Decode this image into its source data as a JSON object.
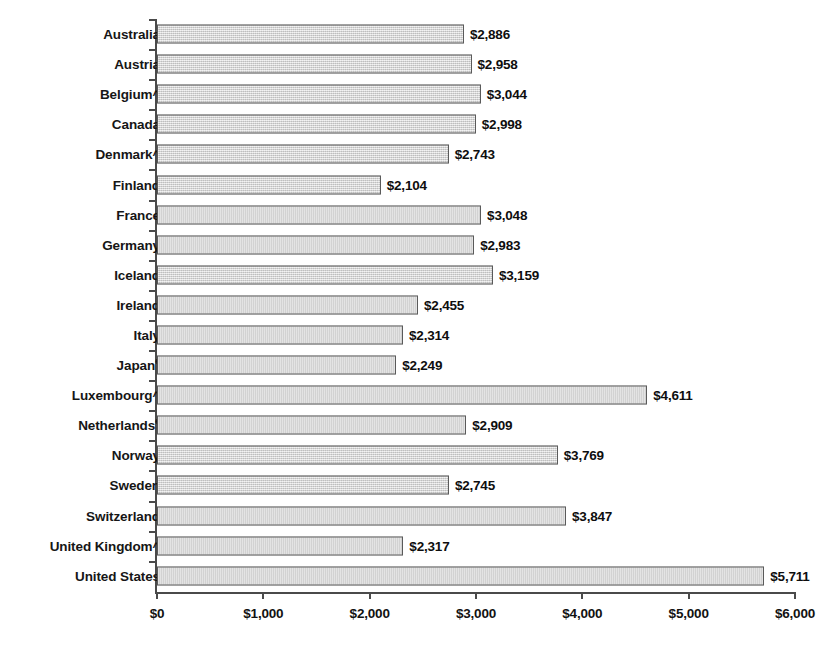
{
  "chart_data": {
    "type": "bar",
    "orientation": "horizontal",
    "title": "",
    "subtitle": "",
    "xlabel": "",
    "ylabel": "",
    "xlim": [
      0,
      6000
    ],
    "grid": false,
    "legend": null,
    "value_prefix": "$",
    "categories": [
      "Australia",
      "Austria",
      "Belgium^",
      "Canada",
      "Denmark^",
      "Finland",
      "France",
      "Germany",
      "Iceland",
      "Ireland",
      "Italy",
      "Japanᵉ",
      "Luxembourg^",
      "Netherlandsᵉ",
      "Norway",
      "Sweden",
      "Switzerland",
      "United Kingdom^",
      "United States"
    ],
    "values": [
      2886,
      2958,
      3044,
      2998,
      2743,
      2104,
      3048,
      2983,
      3159,
      2455,
      2314,
      2249,
      4611,
      2909,
      3769,
      2745,
      3847,
      2317,
      5711
    ],
    "value_labels": [
      "$2,886",
      "$2,958",
      "$3,044",
      "$2,998",
      "$2,743",
      "$2,104",
      "$3,048",
      "$2,983",
      "$3,159",
      "$2,455",
      "$2,314",
      "$2,249",
      "$4,611",
      "$2,909",
      "$3,769",
      "$2,745",
      "$3,847",
      "$2,317",
      "$5,711"
    ],
    "category_marks": [
      "",
      "",
      "^",
      "",
      "^",
      "",
      "",
      "",
      "",
      "",
      "",
      "e",
      "^",
      "e",
      "",
      "",
      "",
      "^",
      ""
    ],
    "category_base": [
      "Australia",
      "Austria",
      "Belgium",
      "Canada",
      "Denmark",
      "Finland",
      "France",
      "Germany",
      "Iceland",
      "Ireland",
      "Italy",
      "Japan",
      "Luxembourg",
      "Netherlands",
      "Norway",
      "Sweden",
      "Switzerland",
      "United Kingdom",
      "United States"
    ],
    "xticks": [
      0,
      1000,
      2000,
      3000,
      4000,
      5000,
      6000
    ],
    "xtick_labels": [
      "$0",
      "$1,000",
      "$2,000",
      "$3,000",
      "$4,000",
      "$5,000",
      "$6,000"
    ],
    "colors": {
      "bar_fill": "#d4d4d4",
      "bar_border": "#5a5a5a",
      "axis": "#4a4a4a",
      "text": "#111111",
      "background": "#ffffff"
    }
  }
}
